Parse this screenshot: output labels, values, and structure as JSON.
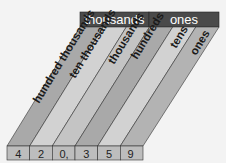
{
  "diagram": {
    "period_headers": [
      {
        "label": "thousands"
      },
      {
        "label": "ones"
      }
    ],
    "place_columns": [
      {
        "label": "hundred thousands",
        "digit": "4"
      },
      {
        "label": "ten thousands",
        "digit": "2"
      },
      {
        "label": "thousands",
        "digit": "0,"
      },
      {
        "label": "hundreds",
        "digit": "3"
      },
      {
        "label": "tens",
        "digit": "5"
      },
      {
        "label": "ones",
        "digit": "9"
      }
    ],
    "number": "420,359",
    "colors": {
      "header_bg": "#4a4a4a",
      "band_dark": "#a9a9a9",
      "band_light": "#d2d2d2",
      "cell_bg": "#bdbdbd",
      "background": "#f3f3f3"
    }
  }
}
